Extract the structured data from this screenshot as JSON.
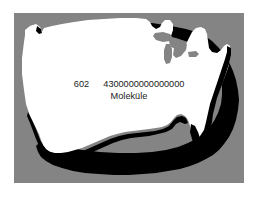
{
  "figure": {
    "background_color": "#ffffff",
    "panel_color": "#848484",
    "map_fill_color": "#ffffff",
    "map_shadow_color": "#000000",
    "text_color": "#1b1b1b"
  },
  "caption": {
    "coefficient": "602",
    "molecule_count": "4300000000000000",
    "unit_label": "Moleküle"
  },
  "map": {
    "name": "united-states-silhouette",
    "region": "United States (contiguous)"
  }
}
